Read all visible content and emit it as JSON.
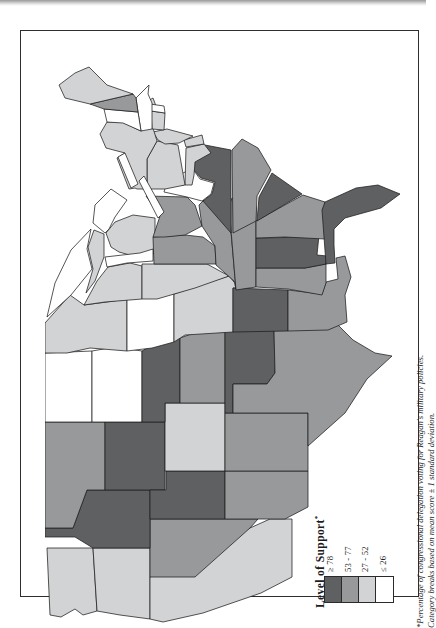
{
  "figure": {
    "legend": {
      "title": "Level of Support",
      "note_mark": "*",
      "support_levels": [
        {
          "id": 4,
          "label": "≥ 78",
          "color": "#5f6062"
        },
        {
          "id": 3,
          "label": "53 - 77",
          "color": "#97999b"
        },
        {
          "id": 2,
          "label": "27 - 52",
          "color": "#d2d3d5"
        },
        {
          "id": 1,
          "label": "≤ 26",
          "color": "#ffffff"
        }
      ]
    },
    "footnote": {
      "line1": "*Percentage of congressional delegation voting for Reagan's military policies.",
      "line2": "Category breaks based on mean score ± 1 standard deviation."
    },
    "colors": {
      "state_border": "#1e1e1e",
      "water": "#ffffff",
      "frame": "#2e2e2e",
      "page": "#ffffff"
    }
  },
  "chart_data": {
    "type": "choropleth-map",
    "region": "United States (contiguous 48 states)",
    "orientation": "map rotated 90 degrees counterclockwise on page (east at top, north at left)",
    "measure": "Level of Support: percentage of congressional delegation voting for Reagan's military policies",
    "categories": [
      "≥ 78",
      "53 - 77",
      "27 - 52",
      "≤ 26"
    ],
    "legend_position": "bottom-center of rotated figure",
    "states": [
      {
        "abbr": "WA",
        "name": "Washington",
        "category_id": 2,
        "support": "27 - 52"
      },
      {
        "abbr": "OR",
        "name": "Oregon",
        "category_id": 2,
        "support": "27 - 52"
      },
      {
        "abbr": "CA",
        "name": "California",
        "category_id": 2,
        "support": "27 - 52"
      },
      {
        "abbr": "NV",
        "name": "Nevada",
        "category_id": 3,
        "support": "53 - 77"
      },
      {
        "abbr": "ID",
        "name": "Idaho",
        "category_id": 4,
        "support": "≥ 78"
      },
      {
        "abbr": "MT",
        "name": "Montana",
        "category_id": 3,
        "support": "53 - 77"
      },
      {
        "abbr": "WY",
        "name": "Wyoming",
        "category_id": 4,
        "support": "≥ 78"
      },
      {
        "abbr": "UT",
        "name": "Utah",
        "category_id": 4,
        "support": "≥ 78"
      },
      {
        "abbr": "CO",
        "name": "Colorado",
        "category_id": 2,
        "support": "27 - 52"
      },
      {
        "abbr": "AZ",
        "name": "Arizona",
        "category_id": 3,
        "support": "53 - 77"
      },
      {
        "abbr": "NM",
        "name": "New Mexico",
        "category_id": 3,
        "support": "53 - 77"
      },
      {
        "abbr": "ND",
        "name": "North Dakota",
        "category_id": 1,
        "support": "≤ 26"
      },
      {
        "abbr": "SD",
        "name": "South Dakota",
        "category_id": 1,
        "support": "≤ 26"
      },
      {
        "abbr": "NE",
        "name": "Nebraska",
        "category_id": 4,
        "support": "≥ 78"
      },
      {
        "abbr": "KS",
        "name": "Kansas",
        "category_id": 3,
        "support": "53 - 77"
      },
      {
        "abbr": "OK",
        "name": "Oklahoma",
        "category_id": 4,
        "support": "≥ 78"
      },
      {
        "abbr": "TX",
        "name": "Texas",
        "category_id": 3,
        "support": "53 - 77"
      },
      {
        "abbr": "MN",
        "name": "Minnesota",
        "category_id": 2,
        "support": "27 - 52"
      },
      {
        "abbr": "IA",
        "name": "Iowa",
        "category_id": 1,
        "support": "≤ 26"
      },
      {
        "abbr": "MO",
        "name": "Missouri",
        "category_id": 2,
        "support": "27 - 52"
      },
      {
        "abbr": "AR",
        "name": "Arkansas",
        "category_id": 4,
        "support": "≥ 78"
      },
      {
        "abbr": "LA",
        "name": "Louisiana",
        "category_id": 3,
        "support": "53 - 77"
      },
      {
        "abbr": "WI",
        "name": "Wisconsin",
        "category_id": 2,
        "support": "27 - 52"
      },
      {
        "abbr": "IL",
        "name": "Illinois",
        "category_id": 2,
        "support": "27 - 52"
      },
      {
        "abbr": "MI",
        "name": "Michigan",
        "category_id": 2,
        "support": "27 - 52"
      },
      {
        "abbr": "IN",
        "name": "Indiana",
        "category_id": 3,
        "support": "53 - 77"
      },
      {
        "abbr": "OH",
        "name": "Ohio",
        "category_id": 3,
        "support": "53 - 77"
      },
      {
        "abbr": "KY",
        "name": "Kentucky",
        "category_id": 3,
        "support": "53 - 77"
      },
      {
        "abbr": "TN",
        "name": "Tennessee",
        "category_id": 3,
        "support": "53 - 77"
      },
      {
        "abbr": "MS",
        "name": "Mississippi",
        "category_id": 3,
        "support": "53 - 77"
      },
      {
        "abbr": "AL",
        "name": "Alabama",
        "category_id": 4,
        "support": "≥ 78"
      },
      {
        "abbr": "GA",
        "name": "Georgia",
        "category_id": 3,
        "support": "53 - 77"
      },
      {
        "abbr": "FL",
        "name": "Florida",
        "category_id": 4,
        "support": "≥ 78"
      },
      {
        "abbr": "SC",
        "name": "South Carolina",
        "category_id": 4,
        "support": "≥ 78"
      },
      {
        "abbr": "NC",
        "name": "North Carolina",
        "category_id": 3,
        "support": "53 - 77"
      },
      {
        "abbr": "VA",
        "name": "Virginia",
        "category_id": 4,
        "support": "≥ 78"
      },
      {
        "abbr": "WV",
        "name": "West Virginia",
        "category_id": 1,
        "support": "≤ 26"
      },
      {
        "abbr": "MD",
        "name": "Maryland",
        "category_id": 2,
        "support": "27 - 52"
      },
      {
        "abbr": "DE",
        "name": "Delaware",
        "category_id": 2,
        "support": "27 - 52"
      },
      {
        "abbr": "PA",
        "name": "Pennsylvania",
        "category_id": 2,
        "support": "27 - 52"
      },
      {
        "abbr": "NJ",
        "name": "New Jersey",
        "category_id": 2,
        "support": "27 - 52"
      },
      {
        "abbr": "NY",
        "name": "New York",
        "category_id": 2,
        "support": "27 - 52"
      },
      {
        "abbr": "CT",
        "name": "Connecticut",
        "category_id": 2,
        "support": "27 - 52"
      },
      {
        "abbr": "RI",
        "name": "Rhode Island",
        "category_id": 1,
        "support": "≤ 26"
      },
      {
        "abbr": "MA",
        "name": "Massachusetts",
        "category_id": 1,
        "support": "≤ 26"
      },
      {
        "abbr": "VT",
        "name": "Vermont",
        "category_id": 1,
        "support": "≤ 26"
      },
      {
        "abbr": "NH",
        "name": "New Hampshire",
        "category_id": 3,
        "support": "53 - 77"
      },
      {
        "abbr": "ME",
        "name": "Maine",
        "category_id": 2,
        "support": "27 - 52"
      }
    ]
  }
}
